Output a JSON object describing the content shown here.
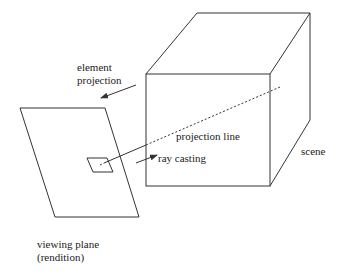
{
  "labels": {
    "element_projection_line1": "element",
    "element_projection_line2": "projection",
    "projection_line": "projection line",
    "ray_casting": "ray casting",
    "scene": "scene",
    "viewing_plane_line1": "viewing plane",
    "viewing_plane_line2": "(rendition)"
  },
  "colors": {
    "stroke": "#333333",
    "background": "#ffffff"
  }
}
